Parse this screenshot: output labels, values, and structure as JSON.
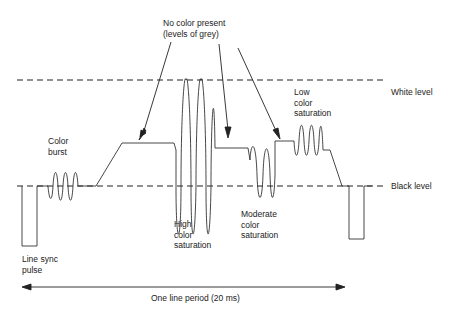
{
  "diagram": {
    "labels": {
      "no_color": "No color present\n(levels of grey)",
      "white_level": "White level",
      "black_level": "Black level",
      "color_burst": "Color\nburst",
      "low_sat": "Low\ncolor\nsaturation",
      "high_sat": "High\ncolor\nsaturation",
      "moderate_sat": "Moderate\ncolor\nsaturation",
      "line_sync": "Line sync\npulse",
      "period": "One line period (20 ms)"
    },
    "colors": {
      "line": "#333333",
      "text": "#222222",
      "background": "#ffffff"
    }
  }
}
